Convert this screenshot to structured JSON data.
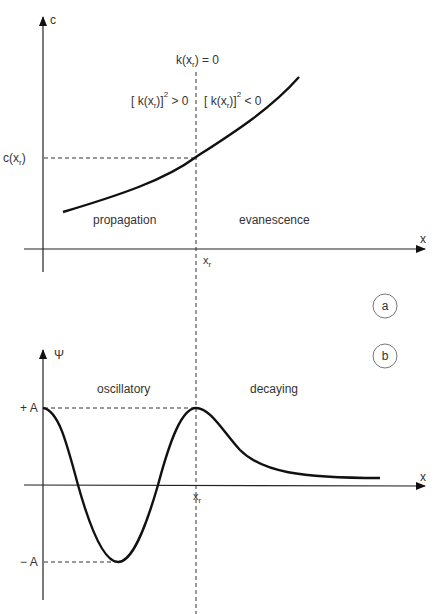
{
  "panel_a": {
    "badge": "a",
    "y_axis_label": "c",
    "x_axis_label": "x",
    "turning_point_label": "x",
    "turning_point_sub": "r",
    "y_marker_label_prefix": "c(x",
    "y_marker_label_sub": "r",
    "y_marker_label_suffix": ")",
    "k_zero_label_prefix": "k(x",
    "k_zero_label_sub": "r",
    "k_zero_label_suffix": ") = 0",
    "k_pos_label_prefix": "[ k(x",
    "k_pos_label_sub": "r",
    "k_pos_label_mid": ")]",
    "k_pos_label_sup": "2",
    "k_pos_label_suffix": " > 0",
    "k_neg_label_prefix": "[ k(x",
    "k_neg_label_sub": "r",
    "k_neg_label_mid": ")]",
    "k_neg_label_sup": "2",
    "k_neg_label_suffix": " < 0",
    "region_left": "propagation",
    "region_right": "evanescence"
  },
  "panel_b": {
    "badge": "b",
    "y_axis_label": "Ψ",
    "x_axis_label": "x",
    "turning_point_label": "x",
    "turning_point_sub": "r",
    "plus_amplitude": "+ A",
    "minus_amplitude": "− A",
    "region_left": "oscillatory",
    "region_right": "decaying"
  },
  "colors": {
    "curve": "#111111",
    "axis": "#222222",
    "dashed": "#333333",
    "text": "#333333",
    "badge_stroke": "#777777"
  }
}
